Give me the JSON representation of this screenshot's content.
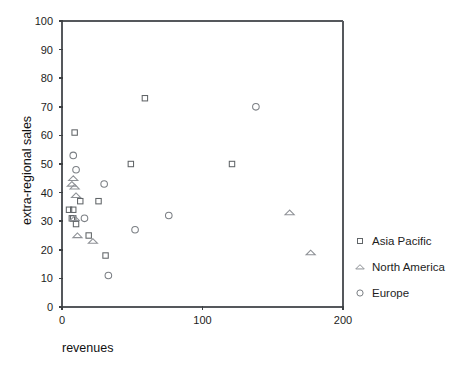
{
  "chart_data": {
    "type": "scatter",
    "title": "",
    "xlabel": "revenues",
    "ylabel": "extra-regional sales",
    "xlim": [
      0,
      200
    ],
    "ylim": [
      0,
      100
    ],
    "xticks": [
      0,
      100,
      200
    ],
    "yticks": [
      0,
      10,
      20,
      30,
      40,
      50,
      60,
      70,
      80,
      90,
      100
    ],
    "xtick_labels": [
      "0",
      "100",
      "200"
    ],
    "ytick_labels": [
      "0",
      "10",
      "20",
      "30",
      "40",
      "50",
      "60",
      "70",
      "80",
      "90",
      "100"
    ],
    "grid": false,
    "legend_position": "right",
    "series": [
      {
        "name": "Asia Pacific",
        "marker": "square",
        "color": "#616568",
        "points": [
          {
            "x": 9,
            "y": 61
          },
          {
            "x": 13,
            "y": 37
          },
          {
            "x": 5,
            "y": 34
          },
          {
            "x": 8,
            "y": 34
          },
          {
            "x": 7,
            "y": 31
          },
          {
            "x": 8,
            "y": 31
          },
          {
            "x": 10,
            "y": 29
          },
          {
            "x": 19,
            "y": 25
          },
          {
            "x": 26,
            "y": 37
          },
          {
            "x": 31,
            "y": 18
          },
          {
            "x": 49,
            "y": 50
          },
          {
            "x": 59,
            "y": 73
          },
          {
            "x": 121,
            "y": 50
          }
        ]
      },
      {
        "name": "North America",
        "marker": "triangle",
        "color": "#8e9196",
        "points": [
          {
            "x": 8,
            "y": 45
          },
          {
            "x": 7,
            "y": 43
          },
          {
            "x": 9,
            "y": 42
          },
          {
            "x": 10,
            "y": 39
          },
          {
            "x": 9,
            "y": 31
          },
          {
            "x": 11,
            "y": 25
          },
          {
            "x": 22,
            "y": 23
          },
          {
            "x": 162,
            "y": 33
          },
          {
            "x": 177,
            "y": 19
          }
        ]
      },
      {
        "name": "Europe",
        "marker": "circle",
        "color": "#7b7f84",
        "points": [
          {
            "x": 8,
            "y": 53
          },
          {
            "x": 10,
            "y": 48
          },
          {
            "x": 30,
            "y": 43
          },
          {
            "x": 16,
            "y": 31
          },
          {
            "x": 52,
            "y": 27
          },
          {
            "x": 76,
            "y": 32
          },
          {
            "x": 138,
            "y": 70
          },
          {
            "x": 33,
            "y": 11
          }
        ]
      }
    ]
  },
  "legend": {
    "entries": [
      {
        "label": "Asia Pacific",
        "marker": "square"
      },
      {
        "label": "North America",
        "marker": "triangle"
      },
      {
        "label": "Europe",
        "marker": "circle"
      }
    ]
  }
}
